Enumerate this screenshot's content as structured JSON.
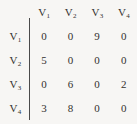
{
  "figure": {
    "name": "adjacency-matrix",
    "background_color": "#f7f6f4",
    "text_color": "#33312f",
    "divider_color": "#4a4a4a"
  },
  "matrix": {
    "column_headers": [
      "V",
      "V",
      "V",
      "V"
    ],
    "column_header_subscripts": [
      "1",
      "2",
      "3",
      "4"
    ],
    "column_headers_full": [
      "V1",
      "V2",
      "V3",
      "V4"
    ],
    "row_headers": [
      "V",
      "V",
      "V",
      "V"
    ],
    "row_header_subscripts": [
      "1",
      "2",
      "3",
      "4"
    ],
    "row_headers_full": [
      "V1",
      "V2",
      "V3",
      "V4"
    ],
    "rows": [
      {
        "label": "V",
        "subscript": "1",
        "values": [
          "0",
          "0",
          "9",
          "0"
        ]
      },
      {
        "label": "V",
        "subscript": "2",
        "values": [
          "5",
          "0",
          "0",
          "0"
        ]
      },
      {
        "label": "V",
        "subscript": "3",
        "values": [
          "0",
          "6",
          "0",
          "2"
        ]
      },
      {
        "label": "V",
        "subscript": "4",
        "values": [
          "3",
          "8",
          "0",
          "0"
        ]
      }
    ]
  },
  "chart_data": {
    "type": "table",
    "title": "",
    "xlabel": "",
    "ylabel": "",
    "categories": [
      "V1",
      "V2",
      "V3",
      "V4"
    ],
    "row_categories": [
      "V1",
      "V2",
      "V3",
      "V4"
    ],
    "series": [
      {
        "name": "V1",
        "values": [
          0,
          0,
          9,
          0
        ]
      },
      {
        "name": "V2",
        "values": [
          5,
          0,
          0,
          0
        ]
      },
      {
        "name": "V3",
        "values": [
          0,
          6,
          0,
          2
        ]
      },
      {
        "name": "V4",
        "values": [
          3,
          8,
          0,
          0
        ]
      }
    ],
    "grid": false,
    "legend": "none"
  }
}
